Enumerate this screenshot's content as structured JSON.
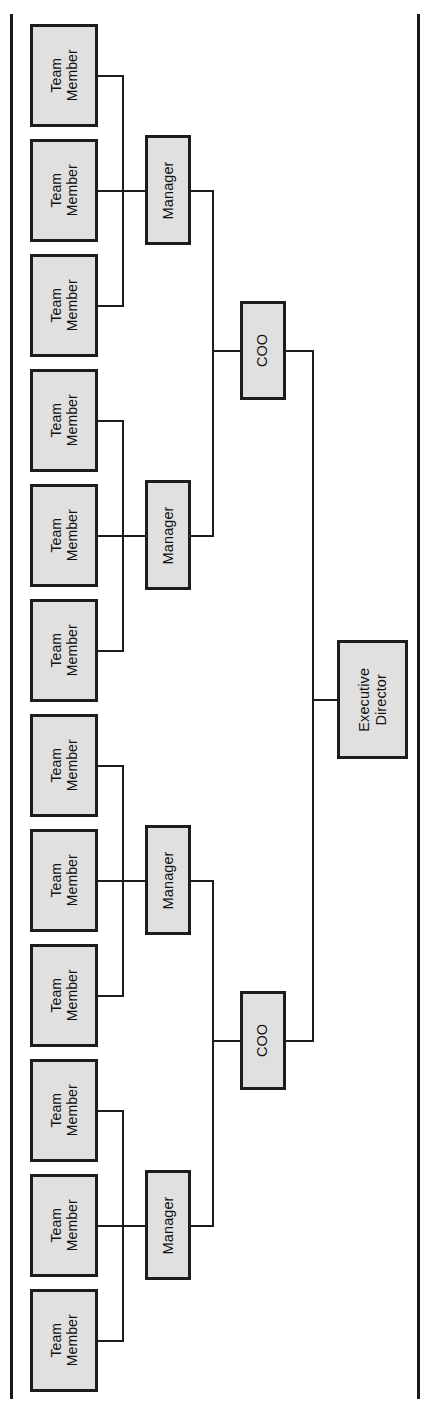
{
  "chart": {
    "type": "org-chart",
    "orientation": "rotated-90-ccw",
    "page_width": 432,
    "page_height": 1413,
    "colors": {
      "node_fill": "#e0e0e0",
      "node_border": "#1c1c1c",
      "connector": "#1c1c1c",
      "background": "#ffffff",
      "text": "#111111"
    },
    "levels": [
      {
        "name": "executive",
        "label": "Executive Director",
        "count": 1
      },
      {
        "name": "operations",
        "label": "COO",
        "count": 2
      },
      {
        "name": "management",
        "label": "Manager",
        "count": 4
      },
      {
        "name": "staff",
        "label": "Team Member",
        "count": 12
      }
    ],
    "hierarchy": {
      "root": {
        "id": "exec-director",
        "label": "Executive Director",
        "role": "Executive Director",
        "children": [
          {
            "id": "coo-1",
            "label": "COO",
            "role": "COO",
            "children": [
              {
                "id": "manager-1",
                "label": "Manager",
                "role": "Manager",
                "children": [
                  {
                    "id": "team-member-1",
                    "label": "Team Member",
                    "role": "Team Member"
                  },
                  {
                    "id": "team-member-2",
                    "label": "Team Member",
                    "role": "Team Member"
                  },
                  {
                    "id": "team-member-3",
                    "label": "Team Member",
                    "role": "Team Member"
                  }
                ]
              },
              {
                "id": "manager-2",
                "label": "Manager",
                "role": "Manager",
                "children": [
                  {
                    "id": "team-member-4",
                    "label": "Team Member",
                    "role": "Team Member"
                  },
                  {
                    "id": "team-member-5",
                    "label": "Team Member",
                    "role": "Team Member"
                  },
                  {
                    "id": "team-member-6",
                    "label": "Team Member",
                    "role": "Team Member"
                  }
                ]
              }
            ]
          },
          {
            "id": "coo-2",
            "label": "COO",
            "role": "COO",
            "children": [
              {
                "id": "manager-3",
                "label": "Manager",
                "role": "Manager",
                "children": [
                  {
                    "id": "team-member-7",
                    "label": "Team Member",
                    "role": "Team Member"
                  },
                  {
                    "id": "team-member-8",
                    "label": "Team Member",
                    "role": "Team Member"
                  },
                  {
                    "id": "team-member-9",
                    "label": "Team Member",
                    "role": "Team Member"
                  }
                ]
              },
              {
                "id": "manager-4",
                "label": "Manager",
                "role": "Manager",
                "children": [
                  {
                    "id": "team-member-10",
                    "label": "Team Member",
                    "role": "Team Member"
                  },
                  {
                    "id": "team-member-11",
                    "label": "Team Member",
                    "role": "Team Member"
                  },
                  {
                    "id": "team-member-12",
                    "label": "Team Member",
                    "role": "Team Member"
                  }
                ]
              }
            ]
          }
        ]
      }
    }
  },
  "nodes": {
    "team_members": [
      {
        "label": "Team\nMember"
      },
      {
        "label": "Team\nMember"
      },
      {
        "label": "Team\nMember"
      },
      {
        "label": "Team\nMember"
      },
      {
        "label": "Team\nMember"
      },
      {
        "label": "Team\nMember"
      },
      {
        "label": "Team\nMember"
      },
      {
        "label": "Team\nMember"
      },
      {
        "label": "Team\nMember"
      },
      {
        "label": "Team\nMember"
      },
      {
        "label": "Team\nMember"
      },
      {
        "label": "Team\nMember"
      }
    ],
    "managers": [
      {
        "label": "Manager"
      },
      {
        "label": "Manager"
      },
      {
        "label": "Manager"
      },
      {
        "label": "Manager"
      }
    ],
    "coos": [
      {
        "label": "COO"
      },
      {
        "label": "COO"
      }
    ],
    "executive": {
      "label": "Executive\nDirector"
    }
  }
}
